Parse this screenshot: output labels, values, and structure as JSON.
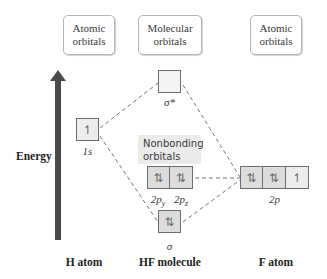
{
  "diagram": {
    "headers": {
      "left": [
        "Atomic",
        "orbitals"
      ],
      "center": [
        "Molecular",
        "orbitals"
      ],
      "right": [
        "Atomic",
        "orbitals"
      ]
    },
    "axis": {
      "label": "Energy",
      "direction": "up",
      "color": "#4a4a4a"
    },
    "h_atom": {
      "label": "H atom",
      "orbitals": [
        {
          "name": "1s",
          "electrons": "↿"
        }
      ]
    },
    "hf_molecule": {
      "label": "HF molecule",
      "antibonding": {
        "name": "σ*",
        "electrons": ""
      },
      "nonbonding_label": [
        "Nonbonding",
        "orbitals"
      ],
      "nonbonding": [
        {
          "name": "2p",
          "sub": "y",
          "electrons": "⇅"
        },
        {
          "name": "2p",
          "sub": "z",
          "electrons": "⇅"
        }
      ],
      "bonding": {
        "name": "σ",
        "electrons": "⇅"
      }
    },
    "f_atom": {
      "label": "F atom",
      "orbital_set_label": "2p",
      "orbitals": [
        {
          "electrons": "⇅"
        },
        {
          "electrons": "⇅"
        },
        {
          "electrons": "↿"
        }
      ]
    },
    "colors": {
      "filled_box": "#dcdcdc",
      "empty_box": "#f4f4f4",
      "nonbonding_bg": "#ebebeb",
      "dashed_line": "#555555"
    }
  }
}
